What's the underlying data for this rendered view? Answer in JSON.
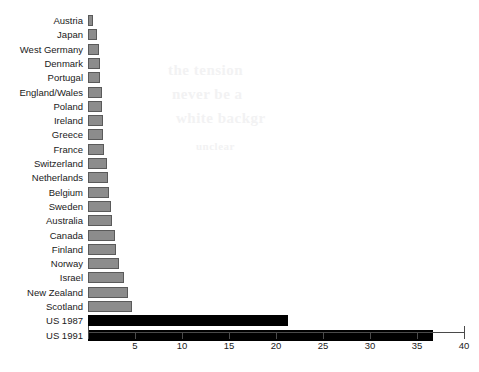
{
  "chart_data": {
    "type": "bar",
    "orientation": "horizontal",
    "title": "",
    "subtitle": "",
    "xlabel": "",
    "ylabel": "",
    "xlim": [
      0,
      40
    ],
    "xticks": [
      0,
      5,
      10,
      15,
      20,
      25,
      30,
      35,
      40
    ],
    "xtick_labels": [
      "",
      "5",
      "10",
      "15",
      "20",
      "25",
      "30",
      "35",
      "40"
    ],
    "grid": false,
    "legend": "none",
    "categories": [
      "Austria",
      "Japan",
      "West Germany",
      "Denmark",
      "Portugal",
      "England/Wales",
      "Poland",
      "Ireland",
      "Greece",
      "France",
      "Switzerland",
      "Netherlands",
      "Belgium",
      "Sweden",
      "Australia",
      "Canada",
      "Finland",
      "Norway",
      "Israel",
      "New Zealand",
      "Scotland",
      "US 1987",
      "US 1991"
    ],
    "values": [
      0.5,
      1.0,
      1.2,
      1.3,
      1.3,
      1.5,
      1.5,
      1.6,
      1.6,
      1.7,
      2.0,
      2.1,
      2.2,
      2.4,
      2.6,
      2.9,
      3.0,
      3.3,
      3.8,
      4.3,
      4.7,
      21.3,
      36.7
    ],
    "bar_colors": [
      "gray",
      "gray",
      "gray",
      "gray",
      "gray",
      "gray",
      "gray",
      "gray",
      "gray",
      "gray",
      "gray",
      "gray",
      "gray",
      "gray",
      "gray",
      "gray",
      "gray",
      "gray",
      "gray",
      "gray",
      "gray",
      "black",
      "black"
    ],
    "colors": {
      "gray_fill": "#8c8c8c",
      "gray_edge": "#5a5a5a",
      "black_fill": "#000000",
      "axis": "#4a4a4a",
      "text": "#1a1a1a",
      "background": "#ffffff"
    }
  },
  "bleed_through": {
    "line1": "the tension",
    "line2": "never be a",
    "line3": "white backgr",
    "line4": "unclear"
  }
}
